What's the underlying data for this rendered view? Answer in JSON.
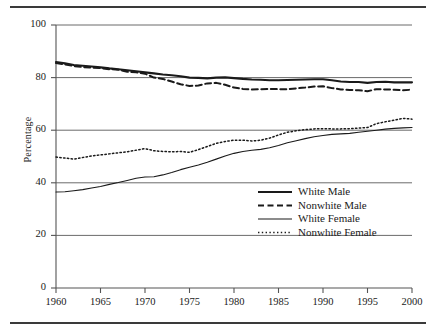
{
  "figure": {
    "ylabel": "Percentage",
    "top_rule": "horizontal-rule",
    "bottom_rule": "horizontal-rule"
  },
  "chart_data": {
    "type": "line",
    "title": "",
    "xlabel": "",
    "ylabel": "Percentage",
    "xlim": [
      1960,
      2000
    ],
    "ylim": [
      0,
      100
    ],
    "xticks": [
      1960,
      1965,
      1970,
      1975,
      1980,
      1985,
      1990,
      1995,
      2000
    ],
    "yticks": [
      0,
      20,
      40,
      60,
      80,
      100
    ],
    "grid": "horizontal",
    "legend_position": "lower-right",
    "x": [
      1960,
      1961,
      1962,
      1963,
      1964,
      1965,
      1966,
      1967,
      1968,
      1969,
      1970,
      1971,
      1972,
      1973,
      1974,
      1975,
      1976,
      1977,
      1978,
      1979,
      1980,
      1981,
      1982,
      1983,
      1984,
      1985,
      1986,
      1987,
      1988,
      1989,
      1990,
      1991,
      1992,
      1993,
      1994,
      1995,
      1996,
      1997,
      1998,
      1999,
      2000
    ],
    "series": [
      {
        "name": "White Male",
        "style": "solid-thick",
        "color": "#1a1a1a",
        "values": [
          85.9,
          85.4,
          84.8,
          84.5,
          84.2,
          83.9,
          83.5,
          83.2,
          82.8,
          82.4,
          82.0,
          81.6,
          81.2,
          80.9,
          80.5,
          80.0,
          79.9,
          79.7,
          80.0,
          80.1,
          79.8,
          79.5,
          79.3,
          79.2,
          79.0,
          79.0,
          79.1,
          79.2,
          79.3,
          79.4,
          79.4,
          79.0,
          78.5,
          78.3,
          78.3,
          78.0,
          78.3,
          78.4,
          78.2,
          78.2,
          78.2
        ]
      },
      {
        "name": "Nonwhite Male",
        "style": "dashed",
        "color": "#1a1a1a",
        "values": [
          85.5,
          85.0,
          84.4,
          84.0,
          83.8,
          83.6,
          83.2,
          83.0,
          82.2,
          82.0,
          81.5,
          80.0,
          79.5,
          78.5,
          77.5,
          76.8,
          77.0,
          77.8,
          78.0,
          77.3,
          76.2,
          75.7,
          75.5,
          75.6,
          75.7,
          75.6,
          75.6,
          75.9,
          76.2,
          76.6,
          76.7,
          76.0,
          75.5,
          75.3,
          75.2,
          74.8,
          75.6,
          75.5,
          75.4,
          75.2,
          75.4
        ]
      },
      {
        "name": "White Female",
        "style": "solid-thin",
        "color": "#1a1a1a",
        "values": [
          36.5,
          36.6,
          37.0,
          37.4,
          38.0,
          38.6,
          39.4,
          40.1,
          40.9,
          41.7,
          42.2,
          42.3,
          43.0,
          43.9,
          45.0,
          45.9,
          46.8,
          47.8,
          49.0,
          50.2,
          51.2,
          51.9,
          52.4,
          52.7,
          53.3,
          54.2,
          55.2,
          56.0,
          56.8,
          57.5,
          58.0,
          58.4,
          58.6,
          58.8,
          59.2,
          59.6,
          60.0,
          60.4,
          60.7,
          60.9,
          61.0
        ]
      },
      {
        "name": "Nonwhite Female",
        "style": "dotted",
        "color": "#1a1a1a",
        "values": [
          49.8,
          49.4,
          49.0,
          49.6,
          50.2,
          50.6,
          51.0,
          51.4,
          51.8,
          52.4,
          53.0,
          52.2,
          51.9,
          51.8,
          51.9,
          51.6,
          52.6,
          53.8,
          55.0,
          55.7,
          56.2,
          56.2,
          55.9,
          56.2,
          57.0,
          58.2,
          59.2,
          59.8,
          60.2,
          60.5,
          60.6,
          60.5,
          60.5,
          60.6,
          60.8,
          61.0,
          62.5,
          63.2,
          63.8,
          64.5,
          64.2
        ]
      }
    ]
  },
  "legend": {
    "items": [
      {
        "label": "White Male",
        "style": "solid-thick"
      },
      {
        "label": "Nonwhite Male",
        "style": "dashed"
      },
      {
        "label": "White Female",
        "style": "solid-thin"
      },
      {
        "label": "Nonwhite Female",
        "style": "dotted"
      }
    ]
  }
}
